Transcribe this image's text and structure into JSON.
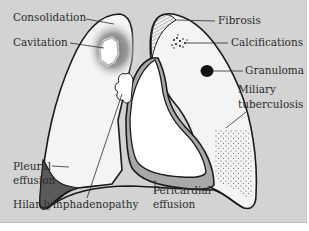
{
  "diagram": {
    "type": "anatomical-illustration",
    "colors": {
      "background": "#d3d3d3",
      "lung_fill": "#f4f4f4",
      "heart_fill": "#ffffff",
      "outline": "#1a1a1a",
      "pericardial_effusion": "#a8a8a8",
      "pleural_effusion": "#5a5a5a",
      "granuloma": "#111111",
      "consolidation_shadow": "#707070"
    },
    "labels": {
      "consolidation": "Consolidation",
      "cavitation": "Cavitation",
      "fibrosis": "Fibrosis",
      "calcifications": "Calcifications",
      "granuloma": "Granuloma",
      "miliary_line1": "Miliary",
      "miliary_line2": "tuberculosis",
      "pleural_line1": "Pleural",
      "pleural_line2": "effusion",
      "hilar": "Hilar lymphadenopathy",
      "pericardial_line1": "Pericardial",
      "pericardial_line2": "effusion"
    }
  }
}
